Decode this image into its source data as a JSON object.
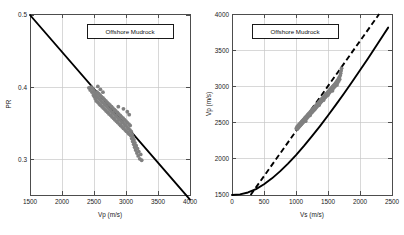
{
  "figure": {
    "background": "#ffffff",
    "scatter_color": "#808080",
    "line_color": "#000000",
    "grid_color": "#c8c8c8"
  },
  "chart_data": [
    {
      "type": "scatter",
      "panel": "left",
      "title": "",
      "annotation": "Offshore Mudrock",
      "xlabel": "Vp (m/s)",
      "ylabel": "PR",
      "xlim": [
        1500,
        4000
      ],
      "ylim": [
        0.25,
        0.5
      ],
      "xticks": [
        1500,
        2000,
        2500,
        3000,
        3500,
        4000
      ],
      "xticklabels": [
        "1500",
        "2000",
        "2500",
        "3000",
        "3500",
        "4000"
      ],
      "yticks": [
        0.3,
        0.4,
        0.5
      ],
      "yticklabels": [
        "0.3",
        "0.4",
        "0.5"
      ],
      "grid": true,
      "legend_position": "top-center",
      "series": [
        {
          "name": "Mudrock trend line",
          "type": "line",
          "style": "solid",
          "color": "#000000",
          "x": [
            1500,
            4000
          ],
          "y": [
            0.5,
            0.245
          ]
        },
        {
          "name": "Offshore mudrock data",
          "type": "scatter",
          "color": "#808080",
          "x_range": [
            2400,
            3260
          ],
          "y_range": [
            0.295,
            0.405
          ],
          "points": [
            [
              2420,
              0.398
            ],
            [
              2440,
              0.395
            ],
            [
              2455,
              0.399
            ],
            [
              2470,
              0.392
            ],
            [
              2480,
              0.397
            ],
            [
              2490,
              0.388
            ],
            [
              2500,
              0.394
            ],
            [
              2505,
              0.386
            ],
            [
              2515,
              0.391
            ],
            [
              2520,
              0.383
            ],
            [
              2530,
              0.389
            ],
            [
              2535,
              0.38
            ],
            [
              2545,
              0.386
            ],
            [
              2550,
              0.392
            ],
            [
              2560,
              0.378
            ],
            [
              2565,
              0.384
            ],
            [
              2575,
              0.39
            ],
            [
              2580,
              0.376
            ],
            [
              2590,
              0.382
            ],
            [
              2595,
              0.388
            ],
            [
              2600,
              0.374
            ],
            [
              2610,
              0.38
            ],
            [
              2615,
              0.386
            ],
            [
              2625,
              0.372
            ],
            [
              2630,
              0.378
            ],
            [
              2640,
              0.384
            ],
            [
              2645,
              0.37
            ],
            [
              2655,
              0.376
            ],
            [
              2660,
              0.382
            ],
            [
              2670,
              0.368
            ],
            [
              2675,
              0.374
            ],
            [
              2685,
              0.38
            ],
            [
              2690,
              0.366
            ],
            [
              2700,
              0.372
            ],
            [
              2705,
              0.378
            ],
            [
              2715,
              0.364
            ],
            [
              2720,
              0.37
            ],
            [
              2730,
              0.376
            ],
            [
              2735,
              0.362
            ],
            [
              2745,
              0.368
            ],
            [
              2750,
              0.374
            ],
            [
              2760,
              0.36
            ],
            [
              2765,
              0.366
            ],
            [
              2775,
              0.372
            ],
            [
              2780,
              0.358
            ],
            [
              2790,
              0.364
            ],
            [
              2795,
              0.37
            ],
            [
              2805,
              0.356
            ],
            [
              2810,
              0.362
            ],
            [
              2820,
              0.368
            ],
            [
              2825,
              0.354
            ],
            [
              2835,
              0.36
            ],
            [
              2840,
              0.366
            ],
            [
              2850,
              0.352
            ],
            [
              2855,
              0.358
            ],
            [
              2865,
              0.364
            ],
            [
              2870,
              0.35
            ],
            [
              2880,
              0.356
            ],
            [
              2885,
              0.362
            ],
            [
              2895,
              0.348
            ],
            [
              2900,
              0.354
            ],
            [
              2910,
              0.36
            ],
            [
              2915,
              0.346
            ],
            [
              2925,
              0.352
            ],
            [
              2930,
              0.358
            ],
            [
              2940,
              0.344
            ],
            [
              2945,
              0.35
            ],
            [
              2955,
              0.356
            ],
            [
              2960,
              0.342
            ],
            [
              2970,
              0.348
            ],
            [
              2975,
              0.354
            ],
            [
              2985,
              0.34
            ],
            [
              2990,
              0.346
            ],
            [
              3000,
              0.352
            ],
            [
              3005,
              0.338
            ],
            [
              3015,
              0.344
            ],
            [
              3020,
              0.35
            ],
            [
              3030,
              0.336
            ],
            [
              3035,
              0.342
            ],
            [
              3045,
              0.348
            ],
            [
              3050,
              0.334
            ],
            [
              3060,
              0.34
            ],
            [
              3065,
              0.346
            ],
            [
              3075,
              0.332
            ],
            [
              3080,
              0.338
            ],
            [
              3090,
              0.328
            ],
            [
              3095,
              0.334
            ],
            [
              3105,
              0.324
            ],
            [
              3110,
              0.33
            ],
            [
              3120,
              0.32
            ],
            [
              3125,
              0.326
            ],
            [
              3135,
              0.316
            ],
            [
              3140,
              0.322
            ],
            [
              3150,
              0.312
            ],
            [
              3160,
              0.318
            ],
            [
              3170,
              0.308
            ],
            [
              3180,
              0.314
            ],
            [
              3190,
              0.304
            ],
            [
              3200,
              0.31
            ],
            [
              3215,
              0.3
            ],
            [
              3230,
              0.306
            ],
            [
              3245,
              0.298
            ],
            [
              3050,
              0.361
            ],
            [
              3020,
              0.365
            ],
            [
              2960,
              0.369
            ],
            [
              2880,
              0.372
            ],
            [
              2640,
              0.392
            ],
            [
              2600,
              0.396
            ],
            [
              2560,
              0.4
            ]
          ]
        }
      ]
    },
    {
      "type": "scatter",
      "panel": "right",
      "title": "",
      "annotation": "Offshore Mudrock",
      "xlabel": "Vs (m/s)",
      "ylabel": "Vp (m/s)",
      "xlim": [
        0,
        2500
      ],
      "ylim": [
        1500,
        4000
      ],
      "xticks": [
        0,
        500,
        1000,
        1500,
        2000,
        2500
      ],
      "xticklabels": [
        "0",
        "500",
        "1000",
        "1500",
        "2000",
        "2500"
      ],
      "yticks": [
        1500,
        2000,
        2500,
        3000,
        3500,
        4000
      ],
      "yticklabels": [
        "1500",
        "2000",
        "2500",
        "3000",
        "3500",
        "4000"
      ],
      "grid": true,
      "legend_position": "top-center",
      "series": [
        {
          "name": "Fitted curve",
          "type": "line",
          "style": "solid",
          "color": "#000000",
          "x": [
            0,
            125,
            250,
            375,
            500,
            625,
            750,
            875,
            1000,
            1125,
            1250,
            1375,
            1500,
            1625,
            1750,
            1875,
            2000,
            2125,
            2250,
            2375,
            2440
          ],
          "y": [
            1500,
            1508,
            1535,
            1582,
            1648,
            1730,
            1826,
            1934,
            2052,
            2178,
            2312,
            2452,
            2598,
            2748,
            2902,
            3060,
            3222,
            3386,
            3554,
            3724,
            3812
          ]
        },
        {
          "name": "Mudrock line (Castagna)",
          "type": "line",
          "style": "dashed",
          "color": "#000000",
          "x": [
            290,
            2300
          ],
          "y": [
            1500,
            4000
          ]
        },
        {
          "name": "Offshore mudrock data",
          "type": "scatter",
          "color": "#808080",
          "x_range": [
            1000,
            1700
          ],
          "y_range": [
            2400,
            3270
          ],
          "points": [
            [
              1005,
              2420
            ],
            [
              1015,
              2440
            ],
            [
              1022,
              2410
            ],
            [
              1030,
              2455
            ],
            [
              1038,
              2430
            ],
            [
              1045,
              2470
            ],
            [
              1052,
              2445
            ],
            [
              1060,
              2485
            ],
            [
              1068,
              2460
            ],
            [
              1075,
              2500
            ],
            [
              1082,
              2475
            ],
            [
              1090,
              2515
            ],
            [
              1098,
              2490
            ],
            [
              1105,
              2530
            ],
            [
              1112,
              2505
            ],
            [
              1120,
              2545
            ],
            [
              1128,
              2520
            ],
            [
              1135,
              2560
            ],
            [
              1142,
              2535
            ],
            [
              1150,
              2575
            ],
            [
              1158,
              2550
            ],
            [
              1165,
              2590
            ],
            [
              1172,
              2565
            ],
            [
              1180,
              2605
            ],
            [
              1188,
              2580
            ],
            [
              1195,
              2620
            ],
            [
              1202,
              2595
            ],
            [
              1210,
              2635
            ],
            [
              1218,
              2610
            ],
            [
              1225,
              2650
            ],
            [
              1232,
              2625
            ],
            [
              1240,
              2665
            ],
            [
              1248,
              2640
            ],
            [
              1255,
              2680
            ],
            [
              1262,
              2655
            ],
            [
              1270,
              2695
            ],
            [
              1278,
              2670
            ],
            [
              1285,
              2710
            ],
            [
              1292,
              2685
            ],
            [
              1300,
              2725
            ],
            [
              1308,
              2700
            ],
            [
              1315,
              2740
            ],
            [
              1322,
              2715
            ],
            [
              1330,
              2755
            ],
            [
              1338,
              2730
            ],
            [
              1345,
              2770
            ],
            [
              1352,
              2745
            ],
            [
              1360,
              2785
            ],
            [
              1368,
              2760
            ],
            [
              1375,
              2800
            ],
            [
              1382,
              2775
            ],
            [
              1390,
              2815
            ],
            [
              1398,
              2790
            ],
            [
              1405,
              2830
            ],
            [
              1412,
              2805
            ],
            [
              1420,
              2845
            ],
            [
              1428,
              2820
            ],
            [
              1435,
              2860
            ],
            [
              1442,
              2835
            ],
            [
              1450,
              2875
            ],
            [
              1458,
              2850
            ],
            [
              1465,
              2890
            ],
            [
              1472,
              2865
            ],
            [
              1480,
              2905
            ],
            [
              1488,
              2880
            ],
            [
              1495,
              2920
            ],
            [
              1502,
              2895
            ],
            [
              1510,
              2935
            ],
            [
              1518,
              2910
            ],
            [
              1525,
              2950
            ],
            [
              1532,
              2925
            ],
            [
              1540,
              2965
            ],
            [
              1548,
              2940
            ],
            [
              1555,
              2980
            ],
            [
              1562,
              2955
            ],
            [
              1570,
              2995
            ],
            [
              1578,
              2970
            ],
            [
              1585,
              3010
            ],
            [
              1592,
              2985
            ],
            [
              1600,
              3025
            ],
            [
              1608,
              3000
            ],
            [
              1615,
              3040
            ],
            [
              1622,
              3015
            ],
            [
              1630,
              3060
            ],
            [
              1638,
              3035
            ],
            [
              1645,
              3080
            ],
            [
              1652,
              3055
            ],
            [
              1660,
              3100
            ],
            [
              1668,
              3075
            ],
            [
              1675,
              3125
            ],
            [
              1682,
              3100
            ],
            [
              1690,
              3150
            ],
            [
              1698,
              3180
            ],
            [
              1705,
              3215
            ],
            [
              1712,
              3250
            ],
            [
              1150,
              2520
            ],
            [
              1220,
              2600
            ],
            [
              1290,
              2680
            ],
            [
              1360,
              2740
            ],
            [
              1430,
              2810
            ],
            [
              1500,
              2880
            ],
            [
              1570,
              2940
            ],
            [
              1640,
              3020
            ]
          ]
        }
      ]
    }
  ]
}
